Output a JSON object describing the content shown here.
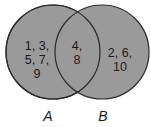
{
  "diagram": {
    "type": "venn",
    "fill_color": "#9a9a9a",
    "stroke_color": "#2a2a2a",
    "sets": [
      {
        "name": "A",
        "label": "A",
        "only_elements_lines": [
          "1, 3,",
          "5, 7,",
          "9"
        ]
      },
      {
        "name": "B",
        "label": "B",
        "only_elements_lines": [
          "2, 6,",
          "10"
        ]
      }
    ],
    "intersection": {
      "elements_lines": [
        "4,",
        "8"
      ]
    },
    "elements": {
      "A_only": [
        1,
        3,
        5,
        7,
        9
      ],
      "A_and_B": [
        4,
        8
      ],
      "B_only": [
        2,
        6,
        10
      ]
    }
  }
}
